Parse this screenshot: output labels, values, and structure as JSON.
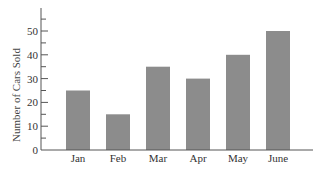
{
  "chart_data": {
    "type": "bar",
    "title": "",
    "xlabel": "",
    "ylabel": "Number of Cars Sold",
    "categories": [
      "Jan",
      "Feb",
      "Mar",
      "Apr",
      "May",
      "June"
    ],
    "values": [
      25,
      15,
      35,
      30,
      40,
      50
    ],
    "ylim": [
      0,
      60
    ],
    "yticks": [
      0,
      10,
      20,
      30,
      40,
      50
    ],
    "minor_tick_step": 5,
    "grid": false,
    "legend": null,
    "bar_color": "#8c8c8c",
    "axis_color": "#555555"
  }
}
